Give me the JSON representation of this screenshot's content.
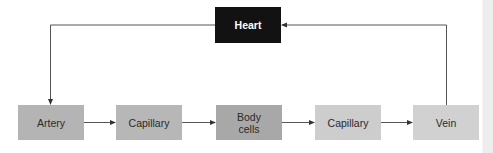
{
  "diagram": {
    "nodes": {
      "heart": {
        "label": "Heart",
        "color": "#121212",
        "text_color": "#ffffff"
      },
      "artery": {
        "label": "Artery",
        "color": "#b4b4b4"
      },
      "capillary_1": {
        "label": "Capillary",
        "color": "#b7b7b7"
      },
      "body_cells": {
        "label": "Body\ncells",
        "color": "#a8a8a8"
      },
      "capillary_2": {
        "label": "Capillary",
        "color": "#cdcdcd"
      },
      "vein": {
        "label": "Vein",
        "color": "#d1d1d1"
      }
    },
    "edges": [
      {
        "from": "Heart",
        "to": "Artery"
      },
      {
        "from": "Artery",
        "to": "Capillary"
      },
      {
        "from": "Capillary",
        "to": "Body cells"
      },
      {
        "from": "Body cells",
        "to": "Capillary"
      },
      {
        "from": "Capillary",
        "to": "Vein"
      },
      {
        "from": "Vein",
        "to": "Heart"
      }
    ],
    "line_color": "#555555"
  }
}
